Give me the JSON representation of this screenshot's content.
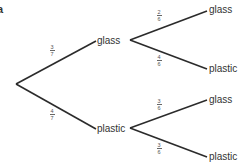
{
  "part_label": "a",
  "tree": {
    "stage1": [
      {
        "outcome": "glass",
        "probability": {
          "num": "3",
          "den": "7"
        }
      },
      {
        "outcome": "plastic",
        "probability": {
          "num": "4",
          "den": "7"
        }
      }
    ],
    "stage2_after_glass": [
      {
        "outcome": "glass",
        "probability": {
          "num": "2",
          "den": "6"
        }
      },
      {
        "outcome": "plastic",
        "probability": {
          "num": "4",
          "den": "6"
        }
      }
    ],
    "stage2_after_plastic": [
      {
        "outcome": "glass",
        "probability": {
          "num": "3",
          "den": "6"
        }
      },
      {
        "outcome": "plastic",
        "probability": {
          "num": "3",
          "den": "6"
        }
      }
    ]
  },
  "colors": {
    "line": "#2b2b2b",
    "text": "#333333",
    "fraction": "#555555"
  }
}
